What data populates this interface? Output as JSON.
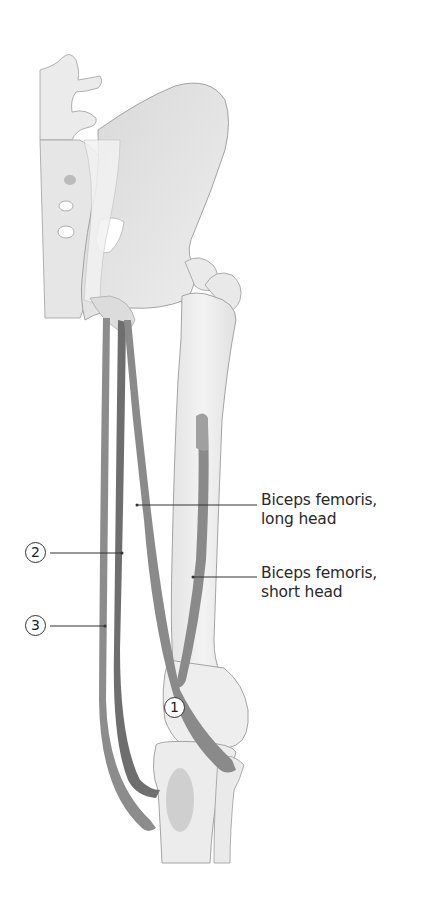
{
  "figure": {
    "colors": {
      "bone": "#ededed",
      "bone_outline": "#9a9a9a",
      "muscle": "#8a8a8a",
      "muscle_dark": "#6e6e6e",
      "label_text": "#2a2a2a",
      "background": "#ffffff"
    }
  },
  "labels": {
    "biceps_long": {
      "line1": "Biceps femoris,",
      "line2": "long head"
    },
    "biceps_short": {
      "line1": "Biceps femoris,",
      "line2": "short head"
    }
  },
  "callouts": [
    {
      "id": "1",
      "text": "1"
    },
    {
      "id": "2",
      "text": "2"
    },
    {
      "id": "3",
      "text": "3"
    }
  ]
}
